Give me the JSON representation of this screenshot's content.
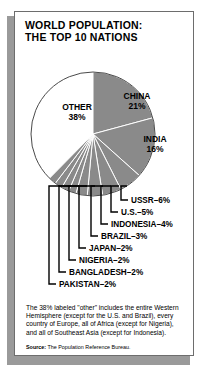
{
  "title": {
    "line1": "WORLD POPULATION:",
    "line2": "THE TOP 10 NATIONS"
  },
  "chart_data": {
    "type": "pie",
    "title": "WORLD POPULATION: THE TOP 10 NATIONS",
    "unit": "%",
    "categories": [
      "OTHER",
      "CHINA",
      "INDIA",
      "USSR",
      "U.S.",
      "INDONESIA",
      "BRAZIL",
      "JAPAN",
      "NIGERIA",
      "BANGLADESH",
      "PAKISTAN"
    ],
    "values": [
      38,
      21,
      16,
      6,
      5,
      4,
      3,
      2,
      2,
      2,
      2
    ],
    "slice_fill": {
      "OTHER": "#ffffff",
      "default": "#8a8a8a"
    },
    "legend": "none",
    "inside_labels": [
      {
        "name": "OTHER",
        "value": "38%",
        "label": "OTHER",
        "pct": "38%"
      },
      {
        "name": "CHINA",
        "value": "21%",
        "label": "CHINA",
        "pct": "21%"
      },
      {
        "name": "INDIA",
        "value": "16%",
        "label": "INDIA",
        "pct": "16%"
      }
    ],
    "callouts": [
      {
        "label": "USSR",
        "value": "6%",
        "text": "USSR–6%"
      },
      {
        "label": "U.S.",
        "value": "5%",
        "text": "U.S.–5%"
      },
      {
        "label": "INDONESIA",
        "value": "4%",
        "text": "INDONESIA–4%"
      },
      {
        "label": "BRAZIL",
        "value": "3%",
        "text": "BRAZIL–3%"
      },
      {
        "label": "JAPAN",
        "value": "2%",
        "text": "JAPAN–2%"
      },
      {
        "label": "NIGERIA",
        "value": "2%",
        "text": "NIGERIA–2%"
      },
      {
        "label": "BANGLADESH",
        "value": "2%",
        "text": "BANGLADESH–2%"
      },
      {
        "label": "PAKISTAN",
        "value": "2%",
        "text": "PAKISTAN–2%"
      }
    ]
  },
  "footnote": "The 38% labeled \"other\" includes the entire Western Hemisphere (except for the U.S. and Brazil), every country of Europe, all of Africa (except for Nigeria), and all of Southeast Asia (except for Indonesia).",
  "source": {
    "label": "Source:",
    "text": "The Population Reference Bureau."
  },
  "colors": {
    "slice_gray": "#8a8a8a",
    "slice_white": "#ffffff",
    "outline": "#3a3a3a",
    "shadow": "#9a9a9a",
    "text": "#000000"
  }
}
